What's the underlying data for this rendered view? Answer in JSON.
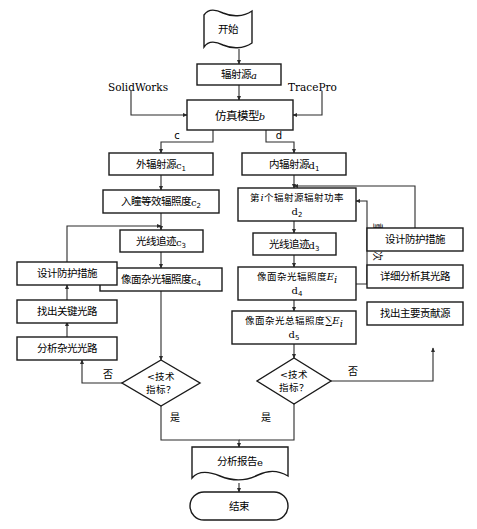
{
  "diagram": {
    "background": "#ffffff",
    "stroke_color": "#1a1a1a",
    "connector_color": "#2b2b2b",
    "nodes": {
      "start": {
        "label": "开始",
        "shape": "document"
      },
      "radiation_source_a": {
        "label": "辐射源",
        "tag": "a",
        "shape": "rect"
      },
      "sim_model_b": {
        "label": "仿真模型",
        "tag": "b",
        "shape": "rect"
      },
      "external_source_c1": {
        "label": "外辐射源",
        "tag": "c",
        "sub": "1",
        "shape": "rect"
      },
      "pupil_irradiance_c2": {
        "label": "入瞳等效辐照度",
        "tag": "c",
        "sub": "2",
        "shape": "rect"
      },
      "ray_trace_c3": {
        "label": "光线追迹",
        "tag": "c",
        "sub": "3",
        "shape": "rect"
      },
      "image_stray_irradiance_c4": {
        "label": "像面杂光辐照度",
        "tag": "c",
        "sub": "4",
        "shape": "rect"
      },
      "internal_source_d1": {
        "label": "内辐射源",
        "tag": "d",
        "sub": "1",
        "shape": "rect"
      },
      "ith_source_power_d2": {
        "label_pre": "第",
        "label_var": "i",
        "label_post": "个辐射源辐射功率",
        "tag": "d",
        "sub": "2",
        "shape": "rect"
      },
      "ray_trace_d3": {
        "label": "光线追迹",
        "tag": "d",
        "sub": "3",
        "shape": "rect"
      },
      "image_stray_irradiance_d4": {
        "label": "像面杂光辐照度",
        "symbol": "E",
        "symbol_sub": "i",
        "tag": "d",
        "sub": "4",
        "shape": "rect"
      },
      "total_stray_irradiance_d5": {
        "label": "像面杂光总辐照度",
        "symbol": "∑E",
        "symbol_sub": "i",
        "tag": "d",
        "sub": "5",
        "shape": "rect"
      },
      "left_design_protection": {
        "label": "设计防护措施",
        "shape": "rect"
      },
      "left_find_key_path": {
        "label": "找出关键光路",
        "shape": "rect"
      },
      "left_analyze_stray_path": {
        "label": "分析杂光光路",
        "shape": "rect"
      },
      "right_design_protection": {
        "label": "设计防护措施",
        "shape": "rect"
      },
      "right_detail_analyze_path": {
        "label": "详细分析其光路",
        "shape": "rect"
      },
      "right_find_main_source": {
        "label": "找出主要贡献源",
        "shape": "rect"
      },
      "decision_left": {
        "line1": "<技术",
        "line2": "指标？",
        "shape": "diamond"
      },
      "decision_right": {
        "line1": "<技术",
        "line2": "指标？",
        "shape": "diamond"
      },
      "analysis_report_e": {
        "label": "分析报告",
        "tag": "e",
        "shape": "document"
      },
      "end": {
        "label": "结束",
        "shape": "terminator"
      }
    },
    "edge_labels": {
      "branch_c": "c",
      "branch_d": "d",
      "left_no": "否",
      "left_yes": "是",
      "right_no": "否",
      "right_yes": "是",
      "repeat_n": "重复N次"
    },
    "tool_labels": {
      "solidworks": "SolidWorks",
      "tracepro": "TracePro"
    }
  }
}
